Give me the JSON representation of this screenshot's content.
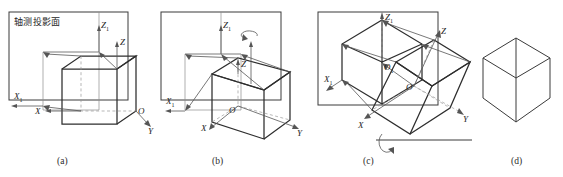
{
  "figure": {
    "panel_count": 4
  },
  "labels": {
    "projection_plane_cn": "轴测投影面",
    "axis_x": "X",
    "axis_y": "Y",
    "axis_z": "Z",
    "axis_x1": "X",
    "axis_z1": "Z",
    "origin_o": "O",
    "origin_o1": "O",
    "sub_one": "1"
  },
  "captions": {
    "a": "(a)",
    "b": "(b)",
    "c": "(c)",
    "d": "(d)"
  },
  "panels": [
    {
      "id": "a",
      "caption": "(a)",
      "has_projection_plane": true,
      "plane_label": "轴测投影面",
      "axes": [
        "X",
        "Y",
        "Z"
      ],
      "projected_axes": [
        "X1",
        "Z1"
      ],
      "origin": "O",
      "rotation_arrow": false,
      "description": "Cube with axes parallel to projection plane"
    },
    {
      "id": "b",
      "caption": "(b)",
      "has_projection_plane": true,
      "plane_label": "",
      "axes": [
        "X",
        "Y",
        "Z"
      ],
      "projected_axes": [
        "X1",
        "Z1"
      ],
      "origin": "O",
      "rotation_arrow": true,
      "rotation_axis": "Z",
      "description": "Cube rotated about the vertical Z axis"
    },
    {
      "id": "c",
      "caption": "(c)",
      "has_projection_plane": true,
      "plane_label": "",
      "axes": [
        "X",
        "Y",
        "Z"
      ],
      "projected_axes": [
        "X1",
        "Z1"
      ],
      "origin": "O",
      "origin_projected": "O1",
      "rotation_arrow": true,
      "rotation_axis": "horizontal",
      "description": "Cube tilted forward about a horizontal axis"
    },
    {
      "id": "d",
      "caption": "(d)",
      "has_projection_plane": false,
      "plane_label": "",
      "axes": [],
      "projected_axes": [],
      "origin": "",
      "rotation_arrow": false,
      "description": "Resulting isometric view of the cube"
    }
  ],
  "colors": {
    "background": "#ffffff",
    "line_solid": "#3a3a3a",
    "line_heavy": "#2e2e2e",
    "line_thin": "#8d8d8d",
    "line_dashed": "#9a9a9a",
    "text": "#1e1e1e"
  }
}
